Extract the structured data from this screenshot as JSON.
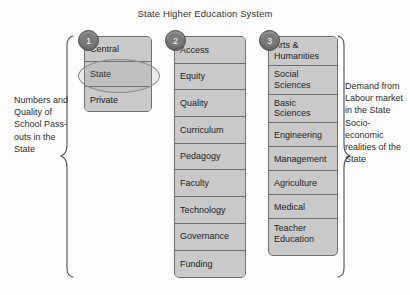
{
  "title": "State Higher Education System",
  "left_caption": "Numbers and Quality of School Pass-outs in the State",
  "right_caption": "Demand from Labour market in the State Socio-economic realities of the State",
  "colors": {
    "box_fill": "#c9c9c9",
    "box_border": "#6f6f6f",
    "circle_fill": "#7b7b7b",
    "circle_border": "#4a4a4a",
    "background": "#fdfdfd",
    "text": "#232323"
  },
  "columns": [
    {
      "number": "1",
      "name": "institution-type",
      "items": [
        {
          "label": "Central",
          "highlighted": false
        },
        {
          "label": "State",
          "highlighted": true
        },
        {
          "label": "Private",
          "highlighted": false
        }
      ]
    },
    {
      "number": "2",
      "name": "system-dimensions",
      "items": [
        {
          "label": "Access"
        },
        {
          "label": "Equity"
        },
        {
          "label": "Quality"
        },
        {
          "label": "Curriculum"
        },
        {
          "label": "Pedagogy"
        },
        {
          "label": "Faculty"
        },
        {
          "label": "Technology"
        },
        {
          "label": "Governance"
        },
        {
          "label": "Funding"
        }
      ]
    },
    {
      "number": "3",
      "name": "disciplines",
      "items": [
        {
          "label": "Arts & Humanities",
          "two_line": true
        },
        {
          "label": "Social Sciences",
          "two_line": true
        },
        {
          "label": "Basic Sciences",
          "two_line": true
        },
        {
          "label": "Engineering",
          "two_line": false
        },
        {
          "label": "Management",
          "two_line": false
        },
        {
          "label": "Agriculture",
          "two_line": false
        },
        {
          "label": "Medical",
          "two_line": false
        },
        {
          "label": "Teacher Education",
          "two_line": true
        }
      ]
    }
  ],
  "braces": {
    "left": "left-curly-brace",
    "right": "right-curly-brace"
  }
}
